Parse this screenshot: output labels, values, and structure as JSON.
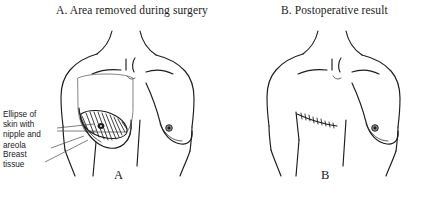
{
  "figure": {
    "kind": "medical-illustration",
    "panel_a": {
      "title": "A. Area removed during surgery",
      "letter": "A",
      "annotations": [
        {
          "id": "ellipse-of-skin",
          "text": "Ellipse of\nskin with\nnipple and\nareola"
        },
        {
          "id": "breast-tissue",
          "text": "Breast\ntissue"
        }
      ]
    },
    "panel_b": {
      "title": "B. Postoperative result",
      "letter": "B"
    }
  },
  "colors": {
    "ink": "#1c1c1c",
    "faint_ink": "#6e6e6e",
    "background": "#ffffff",
    "nipple_fill": "#8f8f8f"
  }
}
